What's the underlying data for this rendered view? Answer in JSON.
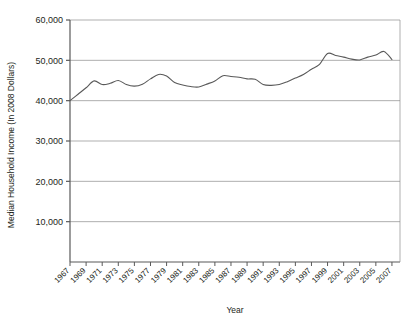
{
  "chart_data": {
    "type": "line",
    "title": "",
    "xlabel": "Year",
    "ylabel": "Median Household Income (In 2008 Dollars)",
    "xlim": [
      1967,
      2008
    ],
    "ylim": [
      0,
      60000
    ],
    "grid": true,
    "legend": "none",
    "ytick_labels": [
      "60,000",
      "50,000",
      "40,000",
      "30,000",
      "20,000",
      "10,000"
    ],
    "ytick_values": [
      60000,
      50000,
      40000,
      30000,
      20000,
      10000
    ],
    "xtick_labels": [
      "1967",
      "1969",
      "1971",
      "1973",
      "1975",
      "1977",
      "1979",
      "1981",
      "1983",
      "1985",
      "1987",
      "1989",
      "1991",
      "1993",
      "1995",
      "1997",
      "1999",
      "2001",
      "2003",
      "2005",
      "2007"
    ],
    "line_color": "#595959",
    "series": [
      {
        "name": "Median Household Income",
        "x": [
          1967,
          1968,
          1969,
          1970,
          1971,
          1972,
          1973,
          1974,
          1975,
          1976,
          1977,
          1978,
          1979,
          1980,
          1981,
          1982,
          1983,
          1984,
          1985,
          1986,
          1987,
          1988,
          1989,
          1990,
          1991,
          1992,
          1993,
          1994,
          1995,
          1996,
          1997,
          1998,
          1999,
          2000,
          2001,
          2002,
          2003,
          2004,
          2005,
          2006,
          2007
        ],
        "values": [
          40000,
          41600,
          43200,
          44900,
          44000,
          44300,
          45000,
          44000,
          43600,
          44100,
          45400,
          46500,
          46100,
          44500,
          43900,
          43500,
          43400,
          44100,
          44900,
          46200,
          46000,
          45800,
          45400,
          45300,
          44000,
          43800,
          44000,
          44700,
          45600,
          46500,
          47800,
          49000,
          51700,
          51200,
          50800,
          50300,
          50100,
          50800,
          51300,
          52200,
          50200
        ]
      }
    ]
  }
}
